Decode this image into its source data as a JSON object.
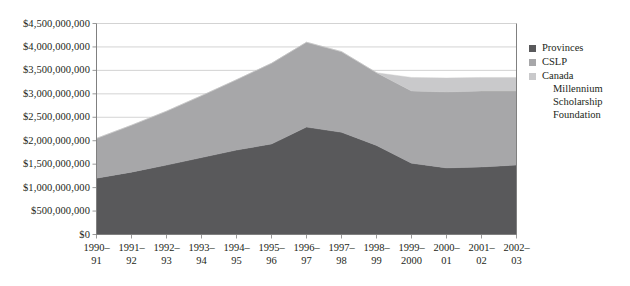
{
  "chart_data": {
    "type": "area",
    "stacked": true,
    "title": "",
    "subtitle": "",
    "xlabel": "",
    "ylabel": "",
    "grid": true,
    "legend_position": "right",
    "ylim": [
      0,
      4500000000
    ],
    "ytick_step": 500000000,
    "ytick_labels": [
      "$4,500,000,000",
      "$4,000,000,000",
      "$3,500,000,000",
      "$3,000,000,000",
      "$2,500,000,000",
      "$2,000,000,000",
      "$1,500,000,000",
      "$1,000,000,000",
      "$500,000,000",
      "$0"
    ],
    "ytick_values": [
      4500000000,
      4000000000,
      3500000000,
      3000000000,
      2500000000,
      2000000000,
      1500000000,
      1000000000,
      500000000,
      0
    ],
    "categories": [
      "1990-91",
      "1991-92",
      "1992-93",
      "1993-94",
      "1994-95",
      "1995-96",
      "1996-97",
      "1997-98",
      "1998-99",
      "1999-2000",
      "2000-01",
      "2001-02",
      "2002-03"
    ],
    "category_labels": [
      [
        "1990–",
        "91"
      ],
      [
        "1991–",
        "92"
      ],
      [
        "1992–",
        "93"
      ],
      [
        "1993–",
        "94"
      ],
      [
        "1994–",
        "95"
      ],
      [
        "1995–",
        "96"
      ],
      [
        "1996–",
        "97"
      ],
      [
        "1997–",
        "98"
      ],
      [
        "1998–",
        "99"
      ],
      [
        "1999–",
        "2000"
      ],
      [
        "2000–",
        "01"
      ],
      [
        "2001–",
        "02"
      ],
      [
        "2002–",
        "03"
      ]
    ],
    "series": [
      {
        "name": "Provinces",
        "color": "#59595b",
        "values": [
          1200000000,
          1330000000,
          1480000000,
          1640000000,
          1800000000,
          1930000000,
          2290000000,
          2180000000,
          1900000000,
          1520000000,
          1420000000,
          1440000000,
          1480000000
        ]
      },
      {
        "name": "CSLP",
        "color": "#a7a7a9",
        "values": [
          850000000,
          1000000000,
          1150000000,
          1320000000,
          1500000000,
          1720000000,
          1810000000,
          1720000000,
          1550000000,
          1540000000,
          1620000000,
          1620000000,
          1580000000
        ]
      },
      {
        "name": "Canada Millennium Scholarship Foundation",
        "color": "#c9c9cb",
        "values": [
          0,
          0,
          0,
          0,
          0,
          0,
          0,
          0,
          0,
          290000000,
          300000000,
          290000000,
          290000000
        ]
      }
    ],
    "totals": [
      2050000000,
      2330000000,
      2630000000,
      2960000000,
      3300000000,
      3650000000,
      4100000000,
      3900000000,
      3450000000,
      3350000000,
      3340000000,
      3350000000,
      3350000000
    ]
  },
  "legend": {
    "items": [
      {
        "label": "Provinces",
        "color": "#59595b",
        "continuation": []
      },
      {
        "label": "CSLP",
        "color": "#a7a7a9",
        "continuation": []
      },
      {
        "label": "Canada",
        "color": "#c9c9cb",
        "continuation": [
          "Millennium",
          "Scholarship",
          "Foundation"
        ]
      }
    ]
  },
  "axes": {
    "axis_color": "#808080",
    "grid_color": "#c0c0c0"
  }
}
